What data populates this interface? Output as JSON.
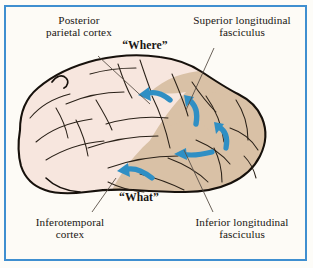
{
  "figure": {
    "kind": "anatomical-diagram",
    "frame_color": "#3f8fd0",
    "background_color": "#fdfbf6",
    "page_background": "#fdfcf8"
  },
  "palette": {
    "frame_blue": "#3f8fd0",
    "arrow_blue": "#2f8fc4",
    "brain_anterior_fill": "#f7e6de",
    "brain_posterior_fill": "#d9c1a6",
    "brain_outline": "#17110c",
    "sulcus_line": "#2a2118",
    "leader_line": "#5a5047",
    "text_color": "#1a1612"
  },
  "labels": {
    "posterior_parietal_cortex": "Posterior\nparietal cortex",
    "superior_longitudinal_fasciculus": "Superior longitudinal\nfasciculus",
    "where_stream": "“Where”",
    "what_stream": "“What”",
    "inferotemporal_cortex": "Inferotemporal\ncortex",
    "inferior_longitudinal_fasciculus": "Inferior longitudinal\nfasciculus"
  },
  "leader_lines": [
    {
      "name": "leader-posterior-parietal-cortex",
      "from": [
        98,
        56
      ],
      "to": [
        150,
        104
      ]
    },
    {
      "name": "leader-superior-longitudinal-fasciculus",
      "from": [
        214,
        48
      ],
      "to": [
        186,
        110
      ]
    },
    {
      "name": "leader-inferotemporal-cortex",
      "from": [
        92,
        212
      ],
      "to": [
        116,
        178
      ]
    },
    {
      "name": "leader-inferior-longitudinal-fasciculus",
      "from": [
        213,
        212
      ],
      "to": [
        184,
        150
      ]
    }
  ],
  "arrows": [
    {
      "name": "dorsal-stream-arrow-upper-left",
      "direction": "leftward-curving-up",
      "color": "#2f8fc4"
    },
    {
      "name": "dorsal-stream-arrow-upper-right",
      "direction": "upward-curving-left",
      "color": "#2f8fc4"
    },
    {
      "name": "ventral-stream-arrow-mid-right",
      "direction": "upward-curving-left",
      "color": "#2f8fc4"
    },
    {
      "name": "ventral-stream-arrow-mid-left",
      "direction": "leftward",
      "color": "#2f8fc4"
    },
    {
      "name": "ventral-stream-arrow-lower-left",
      "direction": "leftward-curving-up",
      "color": "#2f8fc4"
    }
  ]
}
